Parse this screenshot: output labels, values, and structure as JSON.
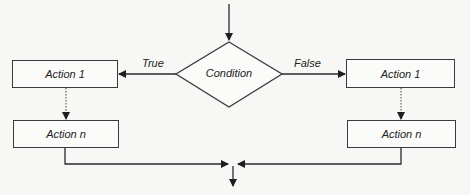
{
  "diagram": {
    "type": "flowchart",
    "decision": {
      "label": "Condition"
    },
    "branches": {
      "true": {
        "label": "True",
        "actions": [
          "Action 1",
          "Action n"
        ]
      },
      "false": {
        "label": "False",
        "actions": [
          "Action 1",
          "Action n"
        ]
      }
    },
    "colors": {
      "stroke": "#2a2a2a",
      "background": "#f7f7f5"
    }
  }
}
